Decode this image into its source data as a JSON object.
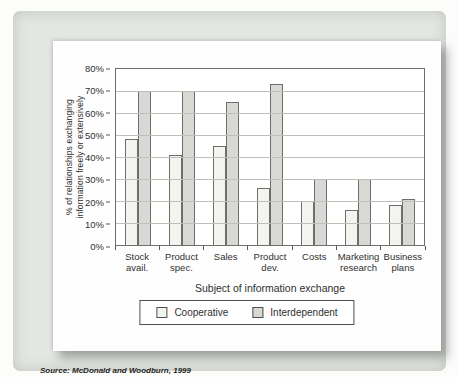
{
  "figure": {
    "source_note": "Source: McDonald and Woodburn, 1999"
  },
  "colors": {
    "cooperative_fill": "#f3f3ef",
    "interdependent_fill": "#d8d8d4",
    "bar_border": "#6e6e6c",
    "panel_bg": "#e3e6e2",
    "card_bg": "#fefefe"
  },
  "y_axis": {
    "tick_labels": [
      "80%",
      "70%",
      "60%",
      "50%",
      "40%",
      "30%",
      "20%",
      "10%",
      "0%"
    ]
  },
  "legend": {
    "items": [
      {
        "label": "Cooperative"
      },
      {
        "label": "Interdependent"
      }
    ]
  },
  "chart_data": {
    "type": "bar",
    "title": "",
    "categories": [
      "Stock avail.",
      "Product spec.",
      "Sales",
      "Product dev.",
      "Costs",
      "Marketing research",
      "Business plans"
    ],
    "series": [
      {
        "name": "Cooperative",
        "values": [
          48,
          41,
          45,
          26,
          20,
          16,
          18
        ]
      },
      {
        "name": "Interdependent",
        "values": [
          70,
          70,
          65,
          73,
          30,
          30,
          21
        ]
      }
    ],
    "xlabel": "Subject of information exchange",
    "ylabel": "% of relationships exchanging information freely or extensively",
    "ylabel_lines": [
      "% of relationships exchanging",
      "information freely or extensively"
    ],
    "ylim": [
      0,
      80
    ],
    "ytick_step": 10,
    "grid": true,
    "legend_position": "bottom-boxed"
  }
}
